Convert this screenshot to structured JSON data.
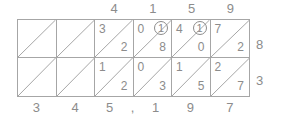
{
  "diagram": {
    "type": "lattice-multiplication",
    "top_labels": [
      "",
      "",
      "4",
      "1",
      "5",
      "9"
    ],
    "right_labels": [
      "8",
      "3"
    ],
    "bottom_labels": [
      "3",
      "4",
      "5",
      ",",
      "1",
      "9",
      "7"
    ],
    "rows": [
      {
        "multiplier": "8",
        "cells": [
          {
            "tens": "",
            "ones": "",
            "carry": ""
          },
          {
            "tens": "",
            "ones": "",
            "carry": ""
          },
          {
            "tens": "3",
            "ones": "2",
            "carry": ""
          },
          {
            "tens": "0",
            "ones": "8",
            "carry": "1"
          },
          {
            "tens": "4",
            "ones": "0",
            "carry": "1"
          },
          {
            "tens": "7",
            "ones": "2",
            "carry": ""
          }
        ]
      },
      {
        "multiplier": "3",
        "cells": [
          {
            "tens": "",
            "ones": "",
            "carry": ""
          },
          {
            "tens": "",
            "ones": "",
            "carry": ""
          },
          {
            "tens": "1",
            "ones": "2",
            "carry": ""
          },
          {
            "tens": "0",
            "ones": "3",
            "carry": ""
          },
          {
            "tens": "1",
            "ones": "5",
            "carry": ""
          },
          {
            "tens": "2",
            "ones": "7",
            "carry": ""
          }
        ]
      }
    ],
    "colors": {
      "line": "#a6a6a6",
      "text": "#8c8c8c",
      "background": "#ffffff"
    }
  }
}
